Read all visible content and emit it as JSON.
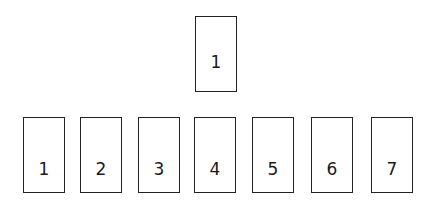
{
  "top_card": {
    "label": "1"
  },
  "row_cards": [
    {
      "label": "1"
    },
    {
      "label": "2"
    },
    {
      "label": "3"
    },
    {
      "label": "4"
    },
    {
      "label": "5"
    },
    {
      "label": "6"
    },
    {
      "label": "7"
    }
  ]
}
